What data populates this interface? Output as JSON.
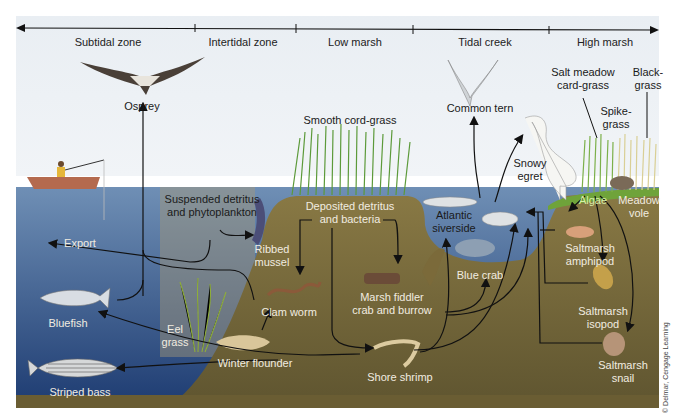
{
  "zones": [
    {
      "label": "Subtidal zone",
      "x": 108
    },
    {
      "label": "Intertidal zone",
      "x": 243
    },
    {
      "label": "Low marsh",
      "x": 353
    },
    {
      "label": "Tidal creek",
      "x": 483
    },
    {
      "label": "High marsh",
      "x": 605
    }
  ],
  "organisms": {
    "osprey": "Osprey",
    "common_tern": "Common tern",
    "smooth_cord_grass": "Smooth cord-grass",
    "salt_meadow_1": "Salt meadow",
    "salt_meadow_2": "card-grass",
    "black_grass_1": "Black-",
    "black_grass_2": "grass",
    "spike_grass_1": "Spike-",
    "spike_grass_2": "grass",
    "snowy_egret_1": "Snowy",
    "snowy_egret_2": "egret",
    "suspended_1": "Suspended detritus",
    "suspended_2": "and phytoplankton",
    "export": "Export",
    "ribbed_mussel_1": "Ribbed",
    "ribbed_mussel_2": "mussel",
    "deposited_1": "Deposited detritus",
    "deposited_2": "and bacteria",
    "atlantic_1": "Atlantic",
    "atlantic_2": "siverside",
    "algae": "Algae",
    "meadow_vole_1": "Meadow",
    "meadow_vole_2": "vole",
    "amphipod_1": "Saltmarsh",
    "amphipod_2": "amphipod",
    "blue_crab": "Blue crab",
    "clam_worm": "Clam worm",
    "fiddler_1": "Marsh fiddler",
    "fiddler_2": "crab and burrow",
    "isopod_1": "Saltmarsh",
    "isopod_2": "isopod",
    "bluefish": "Bluefish",
    "eel_grass_1": "Eel",
    "eel_grass_2": "grass",
    "winter_flounder": "Winter flounder",
    "shore_shrimp": "Shore shrimp",
    "snail_1": "Saltmarsh",
    "snail_2": "snail",
    "striped_bass": "Striped bass"
  },
  "credit": "© Delmar, Cengage Learning",
  "colors": {
    "sky": "#eef2f6",
    "water": "#3a5f8e",
    "water_dark": "#1f3f73",
    "sediment": "#6e6236",
    "marsh_green": "#7aa83a",
    "arrow": "#111111"
  }
}
